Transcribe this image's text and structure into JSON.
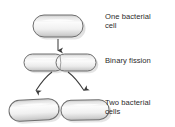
{
  "diagram": {
    "background_color": "#ffffff",
    "outline_color": "#6e6e6e",
    "fill_light": "#fafafa",
    "fill_mid": "#e2e2e2",
    "fill_dark": "#b6b6b6",
    "arrow_color": "#4a4a4a",
    "text_color": "#2b2b2b"
  },
  "labels": {
    "stage_one": "One bacterial\ncell",
    "stage_two": "Binary fission",
    "stage_three": "Two bacterial\ncells"
  },
  "stages": [
    {
      "id": "one-cell",
      "label": "One bacterial cell",
      "cell_count": 1,
      "cells": [
        {
          "name": "parent-cell",
          "cx": 58,
          "cy": 26,
          "width": 50,
          "height": 22
        }
      ]
    },
    {
      "id": "binary-fission",
      "label": "Binary fission",
      "cell_count": 2,
      "cells": [
        {
          "name": "dividing-cell-left",
          "cx": 44,
          "cy": 63,
          "width": 40,
          "height": 17
        },
        {
          "name": "dividing-cell-right",
          "cx": 76,
          "cy": 63,
          "width": 40,
          "height": 17
        }
      ]
    },
    {
      "id": "two-cells",
      "label": "Two bacterial cells",
      "cell_count": 2,
      "cells": [
        {
          "name": "daughter-cell-left",
          "cx": 34,
          "cy": 110,
          "width": 50,
          "height": 21
        },
        {
          "name": "daughter-cell-right",
          "cx": 85,
          "cy": 110,
          "width": 48,
          "height": 20
        }
      ]
    }
  ],
  "arrows": [
    {
      "name": "arrow-division",
      "type": "straight",
      "from": "parent-cell",
      "to": "binary-fission"
    },
    {
      "name": "arrow-separation-left",
      "type": "curved",
      "from": "dividing-cell-left",
      "to": "daughter-cell-left"
    },
    {
      "name": "arrow-separation-right",
      "type": "curved",
      "from": "dividing-cell-right",
      "to": "daughter-cell-right"
    }
  ]
}
